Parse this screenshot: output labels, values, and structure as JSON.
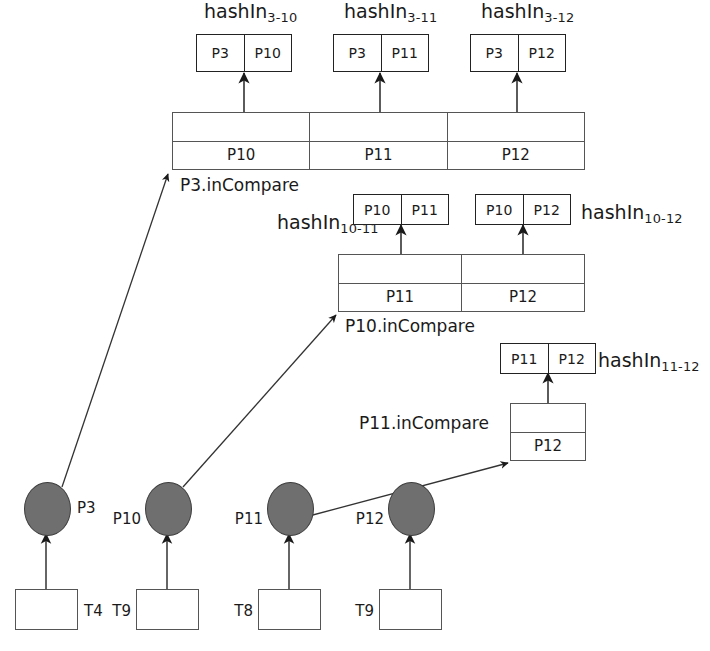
{
  "diagram": {
    "colors": {
      "node_fill": "#6f6f6f",
      "node_stroke": "#3d3d3d",
      "line": "#333333",
      "box_stroke": "#222222",
      "table_stroke": "#555555"
    }
  },
  "hash_boxes": [
    {
      "id": "hashIn-3-10",
      "label_main": "hashIn",
      "label_sub": "3-10",
      "cells": [
        "P3",
        "P10"
      ]
    },
    {
      "id": "hashIn-3-11",
      "label_main": "hashIn",
      "label_sub": "3-11",
      "cells": [
        "P3",
        "P11"
      ]
    },
    {
      "id": "hashIn-3-12",
      "label_main": "hashIn",
      "label_sub": "3-12",
      "cells": [
        "P3",
        "P12"
      ]
    },
    {
      "id": "hashIn-10-11",
      "label_main": "hashIn",
      "label_sub": "10-11",
      "cells": [
        "P10",
        "P11"
      ]
    },
    {
      "id": "hashIn-10-12",
      "label_main": "hashIn",
      "label_sub": "10-12",
      "cells": [
        "P10",
        "P12"
      ]
    },
    {
      "id": "hashIn-11-12",
      "label_main": "hashIn",
      "label_sub": "11-12",
      "cells": [
        "P11",
        "P12"
      ]
    }
  ],
  "compare_tables": [
    {
      "id": "p3-incompare",
      "label": "P3.inCompare",
      "top_row": [
        "",
        "",
        ""
      ],
      "bottom_row": [
        "P10",
        "P11",
        "P12"
      ]
    },
    {
      "id": "p10-incompare",
      "label": "P10.inCompare",
      "top_row": [
        "",
        ""
      ],
      "bottom_row": [
        "P11",
        "P12"
      ]
    },
    {
      "id": "p11-incompare",
      "label": "P11.inCompare",
      "top_row": [
        ""
      ],
      "bottom_row": [
        "P12"
      ]
    }
  ],
  "peers": [
    {
      "id": "p3",
      "label": "P3",
      "label_side": "right",
      "tx_label": "T4",
      "tx_label_side": "right"
    },
    {
      "id": "p10",
      "label": "P10",
      "label_side": "left",
      "tx_label": "T9",
      "tx_label_side": "left"
    },
    {
      "id": "p11",
      "label": "P11",
      "label_side": "left",
      "tx_label": "T8",
      "tx_label_side": "left"
    },
    {
      "id": "p12",
      "label": "P12",
      "label_side": "left",
      "tx_label": "T9",
      "tx_label_side": "left"
    }
  ]
}
